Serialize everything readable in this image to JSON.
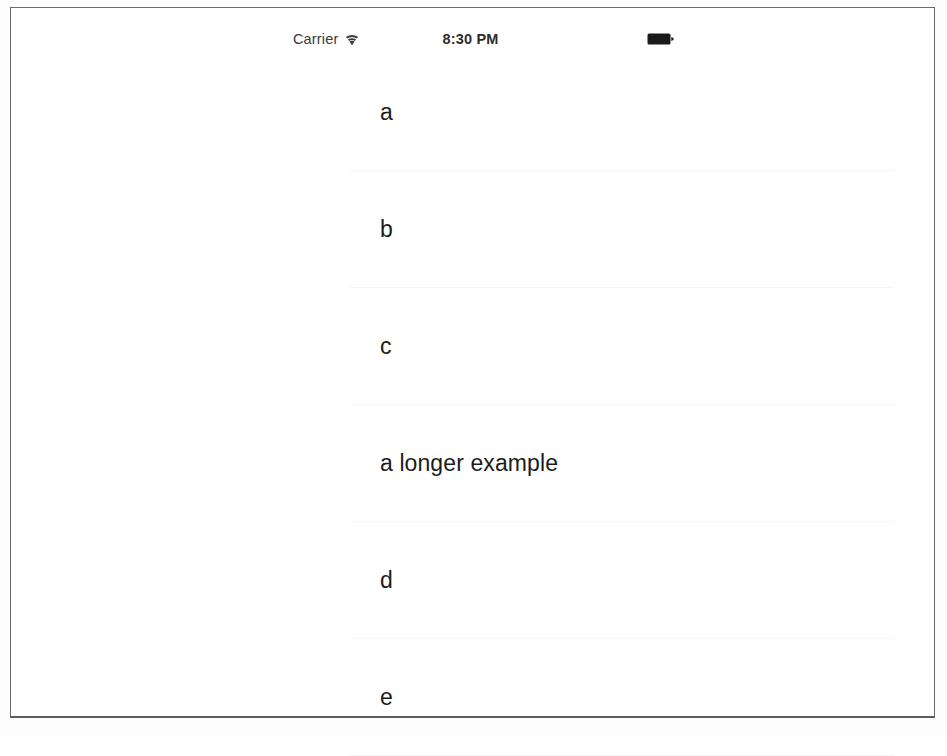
{
  "device": {
    "frame_border_color": "#6a6a6a",
    "screen_background": "#ffffff"
  },
  "status_bar": {
    "carrier_label": "Carrier",
    "wifi_icon": "wifi-icon",
    "time": "8:30 PM",
    "battery_icon": "battery-full-icon"
  },
  "table_view": {
    "rows": [
      {
        "label": "a"
      },
      {
        "label": "b"
      },
      {
        "label": "c"
      },
      {
        "label": "a longer example"
      },
      {
        "label": "d"
      },
      {
        "label": "e"
      }
    ]
  }
}
